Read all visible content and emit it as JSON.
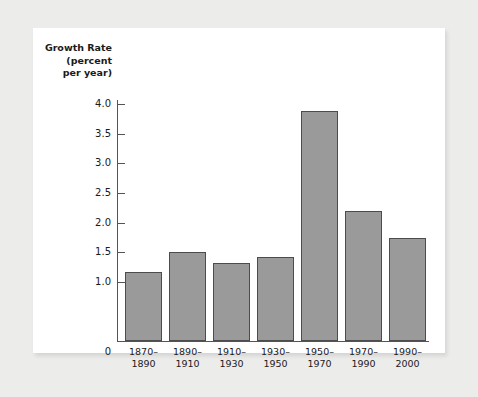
{
  "chart_data": {
    "type": "bar",
    "title": "",
    "subtitle": "",
    "ylabel": "Growth Rate\n(percent\nper year)",
    "xlabel": "",
    "categories": [
      "1870–\n1890",
      "1890–\n1910",
      "1910–\n1930",
      "1930–\n1950",
      "1950–\n1970",
      "1970–\n1990",
      "1990–\n2000"
    ],
    "values": [
      1.17,
      1.5,
      1.32,
      1.42,
      3.88,
      2.2,
      1.73
    ],
    "ylim": [
      0,
      4.0
    ],
    "ytick_labels": [
      "4.0",
      "3.5",
      "3.0",
      "2.5",
      "2.0",
      "1.5",
      "1.0"
    ],
    "ytick_values": [
      4.0,
      3.5,
      3.0,
      2.5,
      2.0,
      1.5,
      1.0
    ],
    "zero_label": "0",
    "grid": false,
    "legend": null,
    "bar_color": "#9a9a9a",
    "bar_edge_color": "#4c4c4c",
    "panel_color": "#ffffff",
    "background_color": "#ececeb",
    "axis_color": "#555555"
  }
}
